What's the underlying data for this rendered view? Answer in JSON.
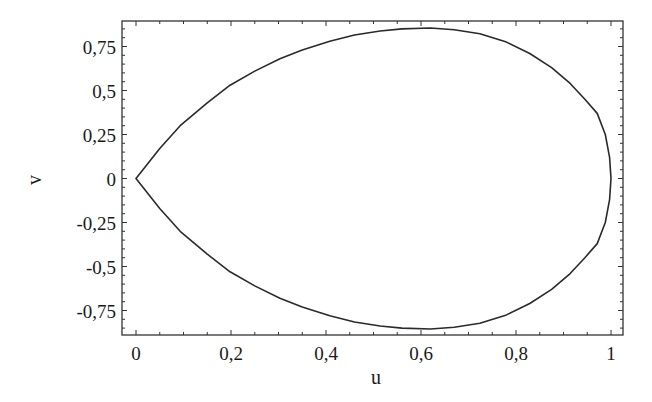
{
  "chart_data": {
    "type": "line",
    "title": "",
    "xlabel": "u",
    "ylabel": "v",
    "xlim": [
      -0.03,
      1.023
    ],
    "ylim": [
      -0.9,
      0.9
    ],
    "grid": false,
    "legend": null,
    "x_ticks": [
      {
        "value": 0,
        "label": "0"
      },
      {
        "value": 0.2,
        "label": "0,2"
      },
      {
        "value": 0.4,
        "label": "0,4"
      },
      {
        "value": 0.6,
        "label": "0,6"
      },
      {
        "value": 0.8,
        "label": "0,8"
      },
      {
        "value": 1,
        "label": "1"
      }
    ],
    "y_ticks": [
      {
        "value": 0.75,
        "label": "0,75"
      },
      {
        "value": 0.5,
        "label": "0,5"
      },
      {
        "value": 0.25,
        "label": "0,25"
      },
      {
        "value": 0,
        "label": "0"
      },
      {
        "value": -0.25,
        "label": "-0,25"
      },
      {
        "value": -0.5,
        "label": "-0,5"
      },
      {
        "value": -0.75,
        "label": "-0,75"
      }
    ],
    "x_minor_step": 0.05,
    "y_minor_step": 0.05,
    "series": [
      {
        "name": "closed teardrop curve (symmetric about v=0)",
        "color": "#2a2a2a",
        "upper_half": {
          "u": [
            0,
            0.05,
            0.093,
            0.15,
            0.198,
            0.25,
            0.303,
            0.35,
            0.408,
            0.46,
            0.514,
            0.56,
            0.62,
            0.67,
            0.724,
            0.78,
            0.829,
            0.875,
            0.914,
            0.945,
            0.971,
            0.988,
            0.997,
            1.0
          ],
          "v": [
            0,
            0.17,
            0.3,
            0.43,
            0.53,
            0.61,
            0.68,
            0.73,
            0.78,
            0.815,
            0.838,
            0.85,
            0.855,
            0.845,
            0.822,
            0.775,
            0.71,
            0.63,
            0.54,
            0.45,
            0.37,
            0.25,
            0.12,
            0
          ]
        },
        "mirrored": true
      }
    ],
    "annotations": []
  }
}
